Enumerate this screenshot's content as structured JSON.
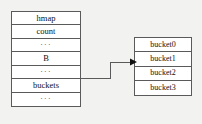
{
  "diagram": {
    "background_color": "#f2f2f0",
    "line_color": "#5a5a5a",
    "text_color": "#111111",
    "hmap_struct": {
      "name": "hmap",
      "fields": [
        {
          "label": "hmap",
          "kind": "header"
        },
        {
          "label": "count",
          "kind": "field"
        },
        {
          "label": "···",
          "kind": "ellipsis"
        },
        {
          "label": "B",
          "kind": "field"
        },
        {
          "label": "···",
          "kind": "ellipsis"
        },
        {
          "label": "buckets",
          "kind": "field"
        },
        {
          "label": "···",
          "kind": "ellipsis"
        }
      ]
    },
    "buckets_array": {
      "name": "buckets",
      "entries": [
        {
          "label": "bucket0"
        },
        {
          "label": "bucket1"
        },
        {
          "label": "bucket2"
        },
        {
          "label": "bucket3"
        }
      ]
    },
    "connector": {
      "from_field": "buckets",
      "to_entry": "bucket1",
      "arrow_head": "triangle-right"
    }
  }
}
